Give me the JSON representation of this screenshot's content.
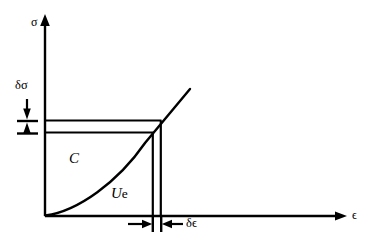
{
  "figure": {
    "type": "annotated-diagram",
    "background_color": "#ffffff",
    "line_color": "#000000"
  },
  "axes": {
    "y_axis": {
      "name": "stress-axis",
      "label": "σ",
      "origin_px": [
        45,
        216
      ],
      "tip_px": [
        45,
        16
      ]
    },
    "x_axis": {
      "name": "strain-axis",
      "label": "ϵ",
      "origin_px": [
        45,
        216
      ],
      "tip_px": [
        346,
        216
      ]
    }
  },
  "curve": {
    "name": "stress-strain-curve",
    "description": "concave-up stress-strain curve from origin",
    "start_px": [
      45,
      216
    ],
    "end_px": [
      190,
      90
    ],
    "knee_px": [
      160,
      123
    ]
  },
  "regions": [
    {
      "name": "complementary-energy-region",
      "label_italic": "C",
      "label_upright": "",
      "position_px": [
        70,
        152
      ]
    },
    {
      "name": "elastic-strain-energy-region",
      "label_italic": "U",
      "label_upright": "e",
      "position_px": [
        112,
        187
      ]
    }
  ],
  "dimensions": [
    {
      "name": "delta-sigma-dimension",
      "label": "δσ",
      "label_position_px": [
        16,
        80
      ],
      "orientation": "vertical",
      "from_px": [
        27,
        121
      ],
      "to_px": [
        27,
        133
      ]
    },
    {
      "name": "delta-epsilon-dimension",
      "label": "δϵ",
      "label_position_px": [
        186,
        219
      ],
      "orientation": "horizontal",
      "from_px": [
        152,
        224
      ],
      "to_px": [
        161,
        224
      ]
    }
  ],
  "guide_lines": [
    {
      "name": "upper-horizontal-guide",
      "from_px": [
        45,
        121
      ],
      "to_px": [
        161,
        121
      ]
    },
    {
      "name": "lower-horizontal-guide",
      "from_px": [
        45,
        133
      ],
      "to_px": [
        153,
        133
      ]
    },
    {
      "name": "right-vertical-guide",
      "from_px": [
        161,
        121
      ],
      "to_px": [
        161,
        216
      ]
    },
    {
      "name": "left-vertical-guide",
      "from_px": [
        153,
        133
      ],
      "to_px": [
        153,
        216
      ]
    }
  ]
}
